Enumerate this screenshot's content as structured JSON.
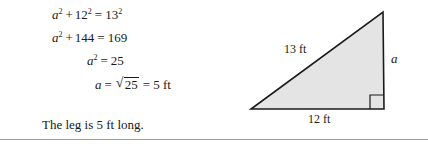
{
  "colors": {
    "ink": "#1a1a1a",
    "triangle_fill": "#e4e4e4",
    "triangle_stroke": "#1a1a1a",
    "rule": "#9a9a9a",
    "background": "#ffffff"
  },
  "solution": {
    "equations": [
      {
        "id": "line1",
        "plain": "a^2 + 12^2 = 13^2",
        "lhs_var": "a",
        "lhs_exp": "2",
        "plus": "+",
        "term2": "12",
        "term2_exp": "2",
        "equals": "=",
        "rhs": "13",
        "rhs_exp": "2"
      },
      {
        "id": "line2",
        "plain": "a^2 + 144 = 169",
        "lhs_var": "a",
        "lhs_exp": "2",
        "plus": "+",
        "term2": "144",
        "equals": "=",
        "rhs": "169"
      },
      {
        "id": "line3",
        "plain": "a^2 = 25",
        "lhs_var": "a",
        "lhs_exp": "2",
        "equals": "=",
        "rhs": "25"
      },
      {
        "id": "line4",
        "plain": "a = sqrt(25) = 5 ft",
        "lhs_var": "a",
        "equals": "=",
        "radical_sign": "√",
        "radicand": "25",
        "equals2": "=",
        "rhs": "5 ft"
      }
    ],
    "conclusion": "The leg is 5 ft long."
  },
  "figure": {
    "shape_name": "right-triangle",
    "labels": {
      "hypotenuse": "13 ft",
      "vertical_leg": "a",
      "base": "12 ft"
    },
    "right_angle_marker": "right-angle-square"
  }
}
